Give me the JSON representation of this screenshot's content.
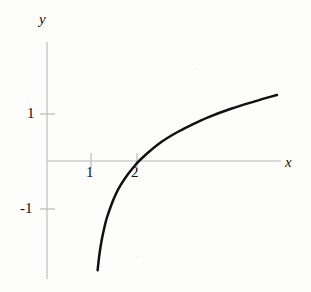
{
  "figure": {
    "background_color": "#fdfdfc",
    "axis_color": "#c9c9c9",
    "curve_color": "#111111",
    "label_color": "#141414"
  },
  "axis_labels": {
    "x": "x",
    "y": "y"
  },
  "tick_labels": {
    "y_positive_one": "1",
    "y_negative_one": "-1",
    "x_one": "1",
    "x_two": "2"
  },
  "chart_data": {
    "type": "line",
    "title": "",
    "subtitle": "",
    "xlabel": "x",
    "ylabel": "y",
    "xlim": [
      0.0,
      5.1
    ],
    "ylim": [
      -2.6,
      2.6
    ],
    "grid": false,
    "legend": "none",
    "annotations": [],
    "function": "y = ln(x - 1)",
    "asymptote": {
      "type": "vertical",
      "x": 1
    },
    "x_intercept": 2,
    "xticks": [
      1,
      2
    ],
    "xticklabels": [
      "1",
      "2"
    ],
    "yticks": [
      -1,
      1
    ],
    "yticklabels": [
      "-1",
      "1"
    ],
    "series": [
      {
        "name": "y = ln(x - 1)",
        "x": [
          1.04,
          1.06,
          1.08,
          1.1,
          1.13,
          1.16,
          1.2,
          1.25,
          1.3,
          1.4,
          1.5,
          1.6,
          1.75,
          1.9,
          2.0,
          2.2,
          2.5,
          2.8,
          3.1,
          3.5,
          4.0,
          4.5,
          5.0,
          5.1
        ],
        "y": [
          -3.22,
          -2.81,
          -2.53,
          -2.3,
          -2.04,
          -1.83,
          -1.61,
          -1.39,
          -1.2,
          -0.92,
          -0.69,
          -0.51,
          -0.29,
          -0.11,
          0.0,
          0.18,
          0.41,
          0.59,
          0.74,
          0.92,
          1.1,
          1.25,
          1.39,
          1.41
        ]
      }
    ]
  }
}
